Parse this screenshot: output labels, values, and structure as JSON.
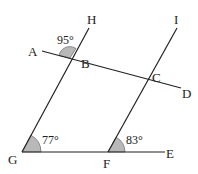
{
  "diagram": {
    "points": {
      "A": "A",
      "B": "B",
      "C": "C",
      "D": "D",
      "E": "E",
      "F": "F",
      "G": "G",
      "H": "H",
      "I": "I"
    },
    "angles": {
      "ABH": "95°",
      "FGB": "77°",
      "EFC": "83°"
    },
    "colors": {
      "line": "#222222",
      "angle_fill": "#b8b8b8"
    }
  }
}
